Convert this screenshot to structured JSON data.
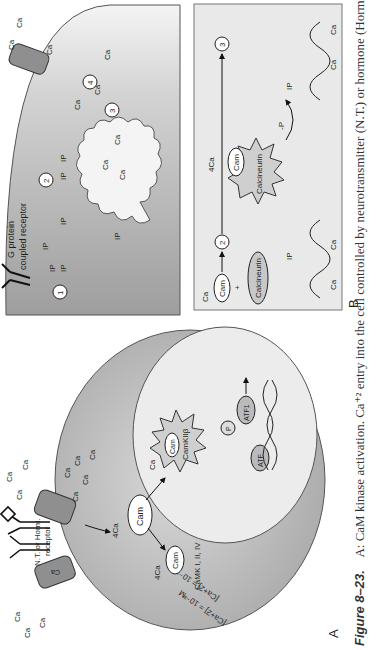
{
  "figure": {
    "number_label": "Figure 8–23.",
    "caption": "A: CaM kinase activation. Ca⁺² entry into the cell controlled by neurotransmitter (N.T.) or hormone (Horm.) receptor"
  },
  "panel_a": {
    "label": "A",
    "receptor_label_1": "N.T. or Horm.",
    "receptor_label_2": "receptor",
    "outside_conc": "[Ca+2] = 10⁻³M",
    "inside_conc": "[Ca+2] = 10⁻⁷M",
    "ca": "Ca",
    "ca_sup": "+2",
    "four_ca": "4Ca",
    "cam": "Cam",
    "camk_family": "CaMK I, II, IV",
    "camk_nuclear": "CamKIIβ",
    "atf": "ATF",
    "atf1": "ATF1",
    "p": "P"
  },
  "panel_b": {
    "label": "B",
    "receptor_label_1": "G protein",
    "receptor_label_2": "coupled receptor",
    "ip3": "IP",
    "ip3_sub": "3",
    "steps": [
      "1",
      "2",
      "3",
      "4"
    ],
    "ca": "Ca",
    "ca_sup": "+2",
    "four_ca": "4Ca",
    "cam": "Cam",
    "plus": "+",
    "calcineurin": "Calcineurin",
    "dephos": "-P",
    "p": "P"
  },
  "colors": {
    "cell_gray": "#b3b3b3",
    "nucleus": "#e8e8e8",
    "box_bg": "#e9e9e9",
    "outline": "#444444"
  }
}
